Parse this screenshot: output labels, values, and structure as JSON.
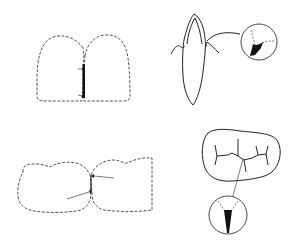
{
  "figure": {
    "type": "dental-diagram",
    "panels": [
      {
        "id": "anterior-contact",
        "description": "Two incisor crowns (dashed outline) with dark contact area and two small arrows at the proximal contact"
      },
      {
        "id": "tooth-sagittal",
        "description": "Longitudinal section of an anterior tooth with gingiva; leader line to magnified circle showing dark wedge-shaped lesion"
      },
      {
        "id": "posterior-contact",
        "description": "Two molar crowns (dashed outline) touching, with two arrows pointing at contact area"
      },
      {
        "id": "occlusal-fissure",
        "description": "Occlusal view of molar with fissure pattern; leader line to magnified circle showing dark V-shaped fissure"
      }
    ],
    "colors": {
      "line": "#333333",
      "fill": "#111111",
      "background": "#ffffff"
    }
  }
}
